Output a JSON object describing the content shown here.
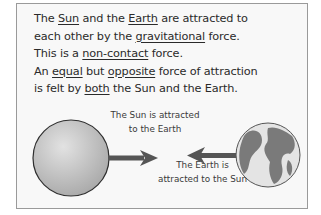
{
  "paragraph": {
    "lines": [
      [
        {
          "text": "The ",
          "underline": false
        },
        {
          "text": "Sun",
          "underline": true
        },
        {
          "text": " and the ",
          "underline": false
        },
        {
          "text": "Earth",
          "underline": true
        },
        {
          "text": " are attracted to",
          "underline": false
        }
      ],
      [
        {
          "text": "each other by the ",
          "underline": false
        },
        {
          "text": "gravitational",
          "underline": true
        },
        {
          "text": " force.",
          "underline": false
        }
      ],
      [
        {
          "text": "This is a ",
          "underline": false
        },
        {
          "text": "non-contact",
          "underline": true
        },
        {
          "text": " force.",
          "underline": false
        }
      ],
      [
        {
          "text": "An ",
          "underline": false
        },
        {
          "text": "equal",
          "underline": true
        },
        {
          "text": " but ",
          "underline": false
        },
        {
          "text": "opposite",
          "underline": true
        },
        {
          "text": " force of attraction",
          "underline": false
        }
      ],
      [
        {
          "text": "is felt by ",
          "underline": false
        },
        {
          "text": "both",
          "underline": true
        },
        {
          "text": " the Sun and the Earth.",
          "underline": false
        }
      ]
    ]
  },
  "diagram": {
    "sun_label": [
      "The Sun is attracted",
      "to the Earth"
    ],
    "earth_label": [
      "The Earth is",
      "attracted to the Sun"
    ],
    "colors": {
      "sun_fill": "#c4c4c4",
      "earth_ocean": "#e6e6e6",
      "earth_land": "#7a7a7a",
      "arrow": "#555555",
      "frame_border": "#9a9a9a"
    }
  }
}
